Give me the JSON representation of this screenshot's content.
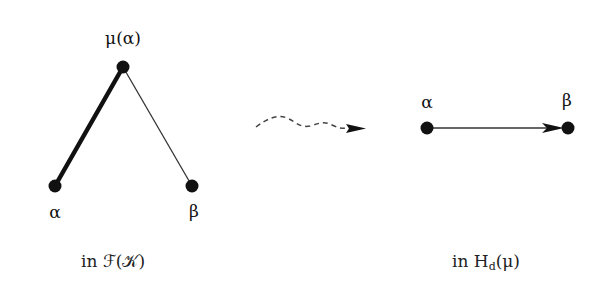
{
  "left_graph": {
    "nodes": {
      "top": {
        "label": "μ(α)"
      },
      "left": {
        "label": "α"
      },
      "right": {
        "label": "β"
      }
    },
    "edges": [
      {
        "from": "α",
        "to": "μ(α)",
        "style": "thick"
      },
      {
        "from": "μ(α)",
        "to": "β",
        "style": "thin"
      }
    ],
    "caption": "in ℱ(𝒦)"
  },
  "transition_arrow": {
    "style": "dashed-squiggly",
    "direction": "right"
  },
  "right_graph": {
    "nodes": {
      "left": {
        "label": "α"
      },
      "right": {
        "label": "β"
      }
    },
    "edges": [
      {
        "from": "α",
        "to": "β",
        "style": "directed"
      }
    ],
    "caption_prefix": "in H",
    "caption_sub": "d",
    "caption_suffix": "(μ)"
  },
  "colors": {
    "ink": "#111111",
    "background": "#ffffff"
  }
}
